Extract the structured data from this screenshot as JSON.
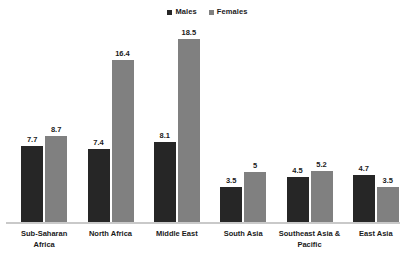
{
  "chart_data": {
    "type": "bar",
    "title": "",
    "subtitle": "",
    "xlabel": "",
    "ylabel": "",
    "ylim": [
      0,
      20
    ],
    "grid": false,
    "legend_position": "top-center",
    "categories": [
      "Sub-Saharan Africa",
      "North Africa",
      "Middle East",
      "South Asia",
      "Southeast Asia & Pacific",
      "East Asia"
    ],
    "series": [
      {
        "name": "Males",
        "color": "#262626",
        "values": [
          7.7,
          7.4,
          8.1,
          3.5,
          4.5,
          4.7
        ],
        "labels": [
          "7.7",
          "7.4",
          "8.1",
          "3.5",
          "4.5",
          "4.7"
        ]
      },
      {
        "name": "Females",
        "color": "#808080",
        "values": [
          8.7,
          16.4,
          18.5,
          5.0,
          5.2,
          3.5
        ],
        "labels": [
          "8.7",
          "16.4",
          "18.5",
          "5",
          "5.2",
          "3.5"
        ]
      }
    ],
    "axis_color": "#c9c9c9"
  },
  "legend": {
    "entries": [
      {
        "label": "Males",
        "color": "#262626"
      },
      {
        "label": "Females",
        "color": "#808080"
      }
    ]
  },
  "categories": [
    {
      "line1": "Sub-Saharan",
      "line2": "Africa"
    },
    {
      "line1": "North Africa",
      "line2": ""
    },
    {
      "line1": "Middle East",
      "line2": ""
    },
    {
      "line1": "South Asia",
      "line2": ""
    },
    {
      "line1": "Southeast Asia &",
      "line2": "Pacific"
    },
    {
      "line1": "East Asia",
      "line2": ""
    }
  ]
}
